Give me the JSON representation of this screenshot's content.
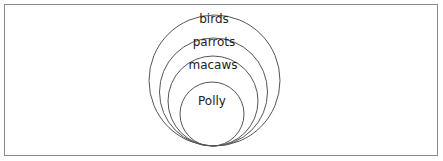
{
  "diagram": {
    "type": "nested-circles",
    "border_color": "#8a8a8a",
    "stroke_color": "#555555",
    "text_color": "#222222",
    "sets": [
      {
        "label": "birds",
        "cx": 214.5,
        "cy": 80.5,
        "r": 65.5,
        "label_x": 214,
        "label_y": 18
      },
      {
        "label": "parrots",
        "cx": 213.5,
        "cy": 92,
        "r": 54,
        "label_x": 214,
        "label_y": 41
      },
      {
        "label": "macaws",
        "cx": 213,
        "cy": 101,
        "r": 45,
        "label_x": 213,
        "label_y": 64
      },
      {
        "label": "Polly",
        "cx": 212,
        "cy": 114,
        "r": 32,
        "label_x": 212,
        "label_y": 98
      }
    ]
  }
}
